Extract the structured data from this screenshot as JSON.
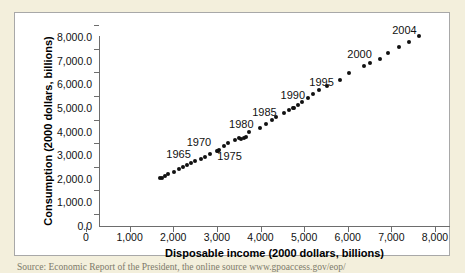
{
  "figure": {
    "background_color": "#f3efdc",
    "panel_color": "#ffffff",
    "panel_border_color": "#a8a8a8",
    "marker_color": "#111111",
    "axis_color": "#6d6d6d",
    "source_caption": "Source: Economic Report of the President, the online source www.gpoaccess.gov/eop/"
  },
  "chart_data": {
    "type": "scatter",
    "title": "",
    "xlabel": "Disposable income (2000 dollars, billions)",
    "ylabel": "Consumption (2000 dollars, billions)",
    "xlim": [
      0,
      8000
    ],
    "ylim": [
      0,
      8000
    ],
    "xticks": [
      0,
      1000,
      2000,
      3000,
      4000,
      5000,
      6000,
      7000,
      8000
    ],
    "yticks": [
      0,
      1000,
      2000,
      3000,
      4000,
      5000,
      6000,
      7000,
      8000
    ],
    "xtick_labels": [
      "0",
      "1,000",
      "2,000",
      "3,000",
      "4,000",
      "5,000",
      "6,000",
      "7,000",
      "8,000"
    ],
    "ytick_labels": [
      "0.0",
      "1,000.0",
      "2,000.0",
      "3,000.0",
      "4,000.0",
      "5,000.0",
      "6,000.0",
      "7,000.0",
      "8,000.0"
    ],
    "grid": false,
    "legend": false,
    "series": [
      {
        "name": "Consumption vs disposable income",
        "points": [
          {
            "year": 1960,
            "x": 1686,
            "y": 1510
          },
          {
            "year": 1961,
            "x": 1731,
            "y": 1541
          },
          {
            "year": 1962,
            "x": 1810,
            "y": 1617
          },
          {
            "year": 1963,
            "x": 1880,
            "y": 1684
          },
          {
            "year": 1964,
            "x": 2008,
            "y": 1785
          },
          {
            "year": 1965,
            "x": 2122,
            "y": 1898
          },
          {
            "year": 1966,
            "x": 2215,
            "y": 2007
          },
          {
            "year": 1967,
            "x": 2318,
            "y": 2063
          },
          {
            "year": 1968,
            "x": 2417,
            "y": 2178
          },
          {
            "year": 1969,
            "x": 2502,
            "y": 2256
          },
          {
            "year": 1970,
            "x": 2626,
            "y": 2318
          },
          {
            "year": 1971,
            "x": 2722,
            "y": 2406
          },
          {
            "year": 1972,
            "x": 2836,
            "y": 2551
          },
          {
            "year": 1973,
            "x": 3019,
            "y": 2675
          },
          {
            "year": 1974,
            "x": 2993,
            "y": 2653
          },
          {
            "year": 1975,
            "x": 3052,
            "y": 2710
          },
          {
            "year": 1976,
            "x": 3162,
            "y": 2868
          },
          {
            "year": 1977,
            "x": 3261,
            "y": 2992
          },
          {
            "year": 1978,
            "x": 3419,
            "y": 3125
          },
          {
            "year": 1979,
            "x": 3509,
            "y": 3203
          },
          {
            "year": 1980,
            "x": 3548,
            "y": 3193
          },
          {
            "year": 1981,
            "x": 3626,
            "y": 3236
          },
          {
            "year": 1982,
            "x": 3658,
            "y": 3275
          },
          {
            "year": 1983,
            "x": 3742,
            "y": 3454
          },
          {
            "year": 1984,
            "x": 3999,
            "y": 3641
          },
          {
            "year": 1985,
            "x": 4133,
            "y": 3820
          },
          {
            "year": 1986,
            "x": 4266,
            "y": 3981
          },
          {
            "year": 1987,
            "x": 4345,
            "y": 4113
          },
          {
            "year": 1988,
            "x": 4538,
            "y": 4280
          },
          {
            "year": 1989,
            "x": 4662,
            "y": 4394
          },
          {
            "year": 1990,
            "x": 4757,
            "y": 4475
          },
          {
            "year": 1991,
            "x": 4738,
            "y": 4467
          },
          {
            "year": 1992,
            "x": 4865,
            "y": 4595
          },
          {
            "year": 1993,
            "x": 4943,
            "y": 4749
          },
          {
            "year": 1994,
            "x": 5081,
            "y": 4928
          },
          {
            "year": 1995,
            "x": 5206,
            "y": 5076
          },
          {
            "year": 1996,
            "x": 5346,
            "y": 5238
          },
          {
            "year": 1997,
            "x": 5531,
            "y": 5424
          },
          {
            "year": 1998,
            "x": 5829,
            "y": 5684
          },
          {
            "year": 1999,
            "x": 6026,
            "y": 5968
          },
          {
            "year": 2000,
            "x": 6362,
            "y": 6258
          },
          {
            "year": 2001,
            "x": 6516,
            "y": 6377
          },
          {
            "year": 2002,
            "x": 6741,
            "y": 6577
          },
          {
            "year": 2003,
            "x": 6914,
            "y": 6818
          },
          {
            "year": 2004,
            "x": 7168,
            "y": 7064
          },
          {
            "year": 2005,
            "x": 7405,
            "y": 7296
          },
          {
            "year": 2006,
            "x": 7628,
            "y": 7552
          }
        ]
      }
    ],
    "annotations": [
      {
        "label": "1965",
        "x": 2122,
        "y": 2530
      },
      {
        "label": "1970",
        "x": 2590,
        "y": 3050
      },
      {
        "label": "1975",
        "x": 3290,
        "y": 2460
      },
      {
        "label": "1980",
        "x": 3560,
        "y": 3810
      },
      {
        "label": "1985",
        "x": 4090,
        "y": 4320
      },
      {
        "label": "1990",
        "x": 4740,
        "y": 5030
      },
      {
        "label": "1995",
        "x": 5400,
        "y": 5600
      },
      {
        "label": "2000",
        "x": 6270,
        "y": 6790
      },
      {
        "label": "2004",
        "x": 7300,
        "y": 7770
      }
    ]
  }
}
